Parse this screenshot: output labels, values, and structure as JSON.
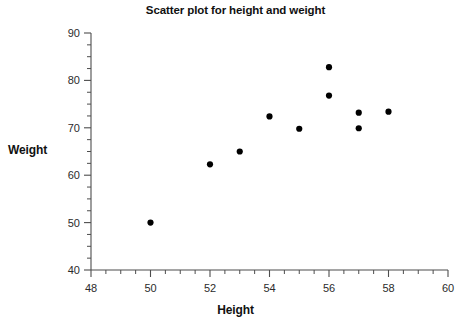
{
  "chart_data": {
    "type": "scatter",
    "title": "Scatter plot for height and weight",
    "xlabel": "Height",
    "ylabel": "Weight",
    "xlim": [
      48,
      60
    ],
    "ylim": [
      40,
      90
    ],
    "xticks": [
      48,
      50,
      52,
      54,
      56,
      58,
      60
    ],
    "xtick_labels": [
      "48",
      "50",
      "52",
      "54",
      "56",
      "58",
      "60"
    ],
    "xtick_minor_step": 0.5,
    "yticks": [
      40,
      50,
      60,
      70,
      80,
      90
    ],
    "ytick_labels": [
      "40",
      "50",
      "60",
      "70",
      "80",
      "90"
    ],
    "ytick_minor_step": 2.5,
    "grid": false,
    "legend": null,
    "marker": "circle",
    "marker_color": "#000000",
    "x": [
      50,
      52,
      53,
      54,
      55,
      56,
      56,
      57,
      57,
      58
    ],
    "y": [
      50.0,
      62.3,
      65.0,
      72.4,
      69.8,
      82.8,
      76.8,
      73.2,
      69.9,
      73.4
    ],
    "points": [
      {
        "height": 50,
        "weight": 50.0
      },
      {
        "height": 52,
        "weight": 62.3
      },
      {
        "height": 53,
        "weight": 65.0
      },
      {
        "height": 54,
        "weight": 72.4
      },
      {
        "height": 55,
        "weight": 69.8
      },
      {
        "height": 56,
        "weight": 82.8
      },
      {
        "height": 56,
        "weight": 76.8
      },
      {
        "height": 57,
        "weight": 73.2
      },
      {
        "height": 57,
        "weight": 69.9
      },
      {
        "height": 58,
        "weight": 73.4
      }
    ]
  }
}
